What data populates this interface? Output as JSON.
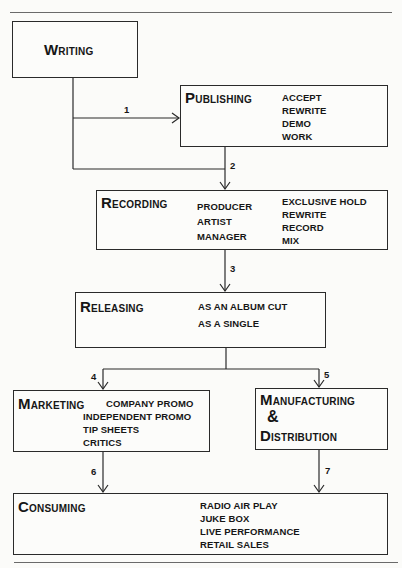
{
  "diagram": {
    "writing": {
      "cap": "W",
      "rest": "RITING"
    },
    "publishing": {
      "cap": "P",
      "rest": "UBLISHING",
      "items": [
        "ACCEPT",
        "REWRITE",
        "DEMO",
        "WORK"
      ]
    },
    "recording": {
      "cap": "R",
      "rest": "ECORDING",
      "people": [
        "PRODUCER",
        "ARTIST",
        "MANAGER"
      ],
      "items": [
        "EXCLUSIVE HOLD",
        "REWRITE",
        "RECORD",
        "MIX"
      ]
    },
    "releasing": {
      "cap": "R",
      "rest": "ELEASING",
      "items": [
        "AS AN ALBUM CUT",
        "AS A SINGLE"
      ]
    },
    "marketing": {
      "cap": "M",
      "rest": "ARKETING",
      "items": [
        "COMPANY PROMO",
        "INDEPENDENT PROMO",
        "TIP SHEETS",
        "CRITICS"
      ]
    },
    "manufacturing": {
      "cap1": "M",
      "rest1": "ANUFACTURING",
      "amp": "&",
      "cap2": "D",
      "rest2": "ISTRIBUTION"
    },
    "consuming": {
      "cap": "C",
      "rest": "ONSUMING",
      "items": [
        "RADIO AIR PLAY",
        "JUKE BOX",
        "LIVE PERFORMANCE",
        "RETAIL SALES"
      ]
    },
    "arrows": [
      "1",
      "2",
      "3",
      "4",
      "5",
      "6",
      "7"
    ]
  }
}
